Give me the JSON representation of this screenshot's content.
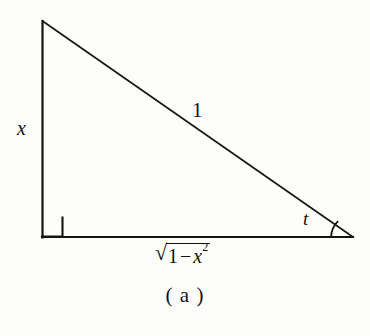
{
  "figure": {
    "caption": "( a )",
    "type": "right-triangle-diagram",
    "background_color": "#fdfdfc",
    "line_color": "#15120f",
    "labels": {
      "vertical_leg": "x",
      "hypotenuse": "1",
      "angle": "t",
      "base_radical_sign": "√",
      "base_radicand_one": "1",
      "base_radicand_minus": "−",
      "base_radicand_x": "x",
      "base_radicand_exponent": "2",
      "base_full": "√(1 − x²)"
    },
    "geometry": {
      "apex": "42,21",
      "right_angle_vertex": "42,237",
      "angle_vertex": "353,237",
      "right_angle_marker_size": "20",
      "angle_arc_radius": "22"
    }
  }
}
